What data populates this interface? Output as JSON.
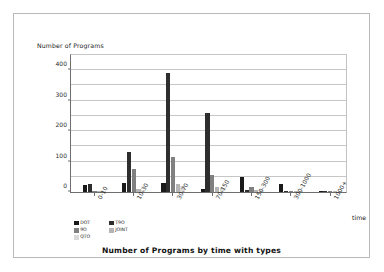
{
  "figure": {
    "title": "Number of Programs by time with types",
    "y_axis_title": "Number of Programs",
    "x_axis_title": "time"
  },
  "chart_data": {
    "type": "bar",
    "title": "Number of Programs by time with types",
    "xlabel": "time",
    "ylabel": "Number of Programs",
    "ylim": [
      0,
      450
    ],
    "yticks": [
      0,
      100,
      200,
      300,
      400
    ],
    "ytick_labels": [
      "0",
      "100",
      "200",
      "300",
      "400"
    ],
    "gridlines": [
      0,
      50,
      100,
      150,
      200,
      250,
      300,
      350,
      400,
      450
    ],
    "grid": true,
    "legend_position": "below-axis-left",
    "categories": [
      "0-10",
      "10-30",
      "30-70",
      "70-150",
      "150-300",
      "300-1000",
      "1000+"
    ],
    "series": [
      {
        "name": "DOT",
        "color": "#1a1a1a",
        "values": [
          22,
          30,
          30,
          10,
          50,
          25,
          2
        ]
      },
      {
        "name": "T9O",
        "color": "#2e2e2e",
        "values": [
          25,
          130,
          390,
          260,
          5,
          3,
          1
        ]
      },
      {
        "name": "9O",
        "color": "#808080",
        "values": [
          4,
          75,
          115,
          55,
          18,
          4,
          1
        ]
      },
      {
        "name": "JOINT",
        "color": "#b5b5b5",
        "values": [
          2,
          10,
          25,
          15,
          8,
          2,
          1
        ]
      },
      {
        "name": "QTO",
        "color": "#dadada",
        "values": [
          1,
          8,
          20,
          14,
          7,
          2,
          1
        ]
      }
    ]
  }
}
